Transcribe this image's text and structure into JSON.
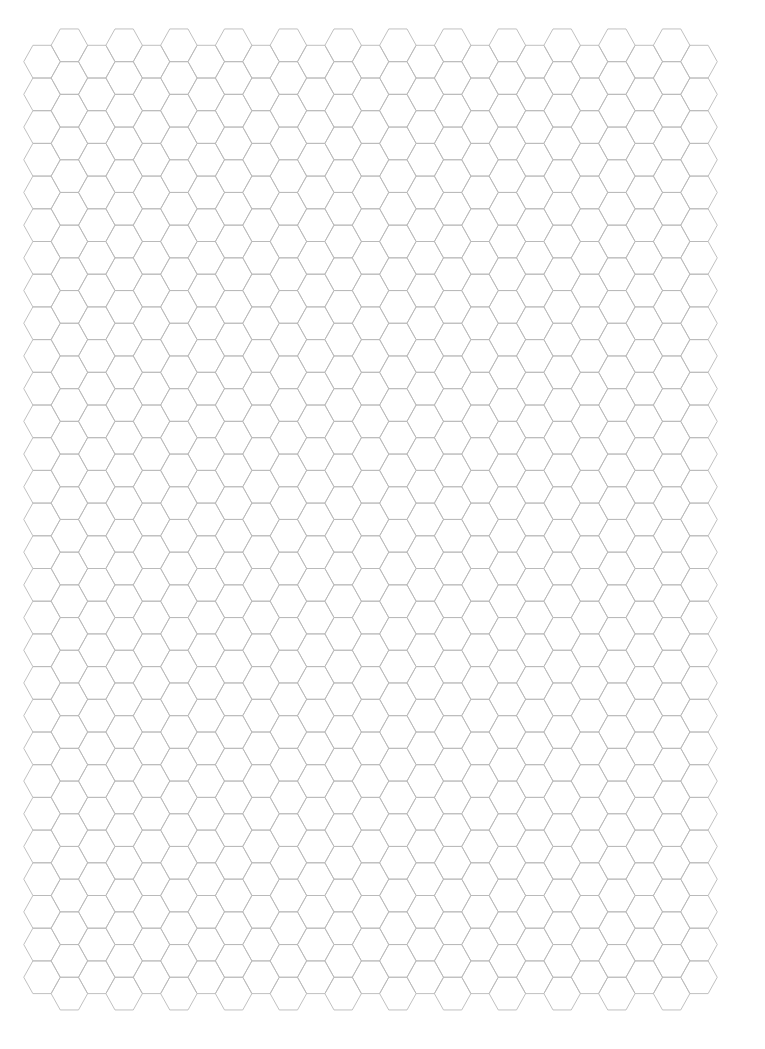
{
  "page": {
    "title": "Hexagonal grid paper",
    "background": "#ffffff"
  },
  "grid": {
    "orientation": "flat-top",
    "columns": 25,
    "rows_even_columns": 29,
    "rows_odd_columns": 30,
    "first_column_center_x": 42.0,
    "column_pitch": 27.375,
    "hex_half_width": 18.25,
    "hex_height": 32.7,
    "even_column_top_y": 45.3,
    "odd_column_top_y": 28.95,
    "line_color": "#b9b9b9",
    "line_width": 0.9
  }
}
